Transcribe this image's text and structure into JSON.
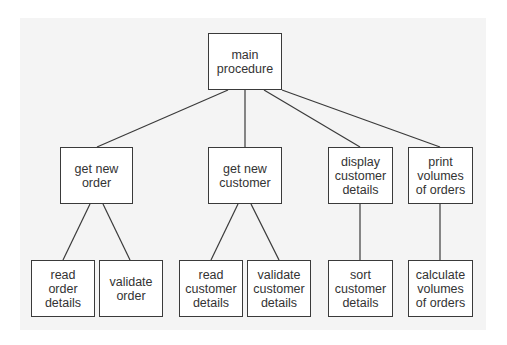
{
  "diagram": {
    "type": "structure-chart",
    "colors": {
      "background_panel": "#f4f4f4",
      "box_fill": "#ffffff",
      "box_border": "#3a3a3a",
      "line": "#3a3a3a",
      "text": "#333333"
    },
    "root": {
      "id": "main",
      "label": "main\nprocedure"
    },
    "level1": [
      {
        "id": "get_new_order",
        "label": "get new\norder"
      },
      {
        "id": "get_new_customer",
        "label": "get new\ncustomer"
      },
      {
        "id": "display_customer_details",
        "label": "display\ncustomer\ndetails"
      },
      {
        "id": "print_volumes_of_orders",
        "label": "print\nvolumes\nof orders"
      }
    ],
    "level2": [
      {
        "id": "read_order_details",
        "parent": "get_new_order",
        "label": "read\norder\ndetails"
      },
      {
        "id": "validate_order",
        "parent": "get_new_order",
        "label": "validate\norder"
      },
      {
        "id": "read_customer_details",
        "parent": "get_new_customer",
        "label": "read\ncustomer\ndetails"
      },
      {
        "id": "validate_customer_details",
        "parent": "get_new_customer",
        "label": "validate\ncustomer\ndetails"
      },
      {
        "id": "sort_customer_details",
        "parent": "display_customer_details",
        "label": "sort\ncustomer\ndetails"
      },
      {
        "id": "calculate_volumes_of_orders",
        "parent": "print_volumes_of_orders",
        "label": "calculate\nvolumes\nof orders"
      }
    ]
  }
}
